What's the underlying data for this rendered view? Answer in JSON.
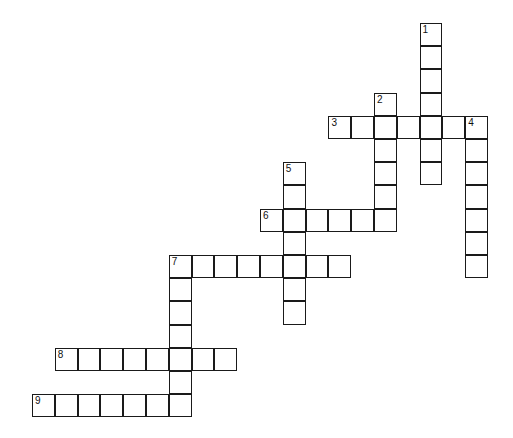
{
  "puzzle": {
    "type": "crossword",
    "cell_size": {
      "w": 22.8,
      "h": 23.2
    },
    "origin": {
      "x": 32,
      "y": 23
    },
    "border_color": "#1a1a1a",
    "entries": [
      {
        "number": "1",
        "direction": "down",
        "col": 17,
        "row": 0,
        "length": 7
      },
      {
        "number": "2",
        "direction": "down",
        "col": 15,
        "row": 3,
        "length": 6
      },
      {
        "number": "3",
        "direction": "across",
        "col": 13,
        "row": 4,
        "length": 7
      },
      {
        "number": "4",
        "direction": "down",
        "col": 19,
        "row": 4,
        "length": 7
      },
      {
        "number": "5",
        "direction": "down",
        "col": 11,
        "row": 6,
        "length": 7
      },
      {
        "number": "6",
        "direction": "across",
        "col": 10,
        "row": 8,
        "length": 6
      },
      {
        "number": "7",
        "direction": "across",
        "col": 6,
        "row": 10,
        "length": 8
      },
      {
        "number": "7",
        "direction": "down",
        "col": 6,
        "row": 10,
        "length": 7
      },
      {
        "number": "8",
        "direction": "across",
        "col": 1,
        "row": 14,
        "length": 8
      },
      {
        "number": "9",
        "direction": "across",
        "col": 0,
        "row": 16,
        "length": 7
      }
    ]
  }
}
